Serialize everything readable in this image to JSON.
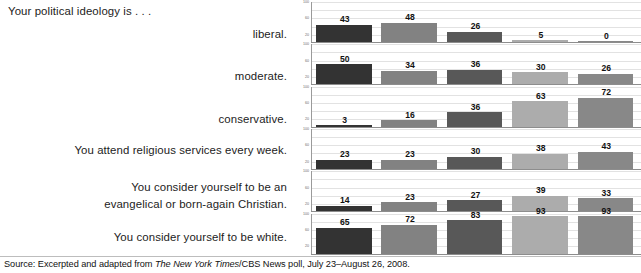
{
  "figure": {
    "lead_text": "Your political ideology is . . .",
    "source_prefix": "Source: Excerpted and adapted from ",
    "source_italic": "The New York Times",
    "source_suffix": "/CBS News poll, July 23–August 26, 2008."
  },
  "prompts": [
    {
      "id": "liberal",
      "lines": [
        "liberal."
      ]
    },
    {
      "id": "moderate",
      "lines": [
        "moderate."
      ]
    },
    {
      "id": "conservative",
      "lines": [
        "conservative."
      ]
    },
    {
      "id": "religious-services",
      "lines": [
        "You attend religious services every week."
      ]
    },
    {
      "id": "evangelical",
      "lines": [
        "You consider yourself to be an",
        "evangelical or born-again Christian."
      ]
    },
    {
      "id": "white",
      "lines": [
        "You consider yourself to be white."
      ]
    }
  ],
  "chart_data": {
    "type": "bar",
    "title": "Your political ideology is . . .",
    "xlabel": "",
    "ylabel": "",
    "ylim": [
      0,
      100
    ],
    "yticks": [
      100,
      60,
      20
    ],
    "gridlines": [
      100,
      80,
      60,
      40,
      20
    ],
    "grid": true,
    "legend": "none",
    "categories": [
      "group 1",
      "group 2",
      "group 3",
      "group 4",
      "group 5"
    ],
    "bar_colors": [
      "#333333",
      "#828282",
      "#585858",
      "#acacac",
      "#888888"
    ],
    "panels": [
      {
        "label": "liberal.",
        "values": [
          43,
          48,
          26,
          5,
          0
        ]
      },
      {
        "label": "moderate.",
        "values": [
          50,
          34,
          36,
          30,
          26
        ]
      },
      {
        "label": "conservative.",
        "values": [
          3,
          16,
          36,
          63,
          72
        ]
      },
      {
        "label": "You attend religious services every week.",
        "values": [
          23,
          23,
          30,
          38,
          43
        ]
      },
      {
        "label": "You consider yourself to be an evangelical or born-again Christian.",
        "values": [
          14,
          23,
          27,
          39,
          33
        ]
      },
      {
        "label": "You consider yourself to be white.",
        "values": [
          65,
          72,
          83,
          93,
          93
        ]
      }
    ]
  }
}
